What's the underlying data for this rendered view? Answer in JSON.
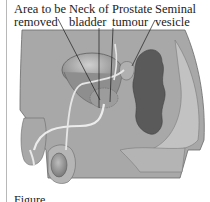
{
  "diagram": {
    "labels": [
      {
        "id": "area",
        "line1": "Area to be",
        "line2": "removed"
      },
      {
        "id": "neck",
        "line1": "Neck of",
        "line2": "bladder"
      },
      {
        "id": "prostate",
        "line1": "Prostate",
        "line2": "tumour"
      },
      {
        "id": "seminal",
        "line1": "Seminal",
        "line2": "vesicle"
      }
    ],
    "caption": "Figure ...",
    "colors": {
      "body": "#a6a6a6",
      "body_light": "#c4c4c4",
      "rectum": "#555555",
      "bladder": "#8c8c8c",
      "urethra": "#e6e6e6",
      "outline": "#5a5a5a"
    }
  }
}
